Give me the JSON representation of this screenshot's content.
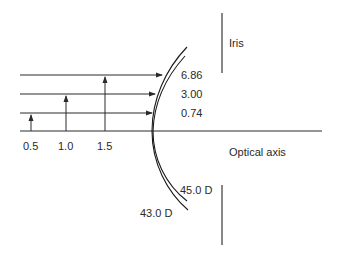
{
  "diagram": {
    "labels": {
      "iris": "Iris",
      "optical_axis": "Optical axis",
      "power_outer": "43.0 D",
      "power_inner": "45.0 D"
    },
    "ray_values": [
      {
        "height_label": "1.5",
        "value_label": "6.86"
      },
      {
        "height_label": "1.0",
        "value_label": "3.00"
      },
      {
        "height_label": "0.5",
        "value_label": "0.74"
      }
    ],
    "colors": {
      "line": "#2a2a2a",
      "iris": "#555555",
      "background": "#ffffff"
    }
  }
}
